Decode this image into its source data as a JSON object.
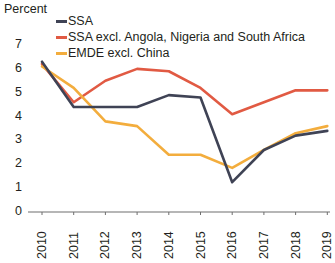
{
  "chart_data": {
    "type": "line",
    "title": "",
    "ylabel": "Percent",
    "xlabel": "",
    "ylim": [
      0,
      7
    ],
    "yticks": [
      "0",
      "1",
      "2",
      "3",
      "4",
      "5",
      "6",
      "7"
    ],
    "grid": false,
    "legend_position": "top-left-inside",
    "categories": [
      "2010",
      "2011",
      "2012",
      "2013",
      "2014",
      "2015",
      "2016",
      "2017",
      "2018",
      "2019"
    ],
    "series": [
      {
        "name": "SSA",
        "color": "#3f4355",
        "values": [
          6.3,
          4.4,
          4.4,
          4.4,
          4.9,
          4.8,
          1.25,
          2.6,
          3.2,
          3.4
        ]
      },
      {
        "name": "SSA excl. Angola, Nigeria and South Africa",
        "color": "#e15a43",
        "values": [
          6.2,
          4.6,
          5.5,
          6.0,
          5.9,
          5.2,
          4.1,
          4.6,
          5.1,
          5.1
        ]
      },
      {
        "name": "EMDE excl. China",
        "color": "#f3ad3d",
        "values": [
          6.1,
          5.2,
          3.8,
          3.6,
          2.4,
          2.4,
          1.85,
          2.6,
          3.3,
          3.6
        ]
      }
    ]
  },
  "axes": {
    "unit_label": "Percent"
  },
  "legend": {
    "items": [
      {
        "label": "SSA",
        "color": "#3f4355"
      },
      {
        "label": "SSA excl. Angola, Nigeria and South Africa",
        "color": "#e15a43"
      },
      {
        "label": "EMDE excl. China",
        "color": "#f3ad3d"
      }
    ]
  }
}
